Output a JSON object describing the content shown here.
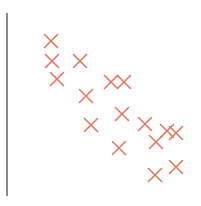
{
  "chart_data": {
    "type": "scatter",
    "title": "",
    "subtitle": "",
    "xlabel": "",
    "ylabel": "",
    "xlim": [
      0,
      201
    ],
    "ylim": [
      206,
      0
    ],
    "grid": false,
    "legend": null,
    "legend_position": "none",
    "annotations": [],
    "xticks": [],
    "yticks": [],
    "xticklabels": [],
    "yticklabels": [],
    "series": [
      {
        "name": "",
        "marker": "x",
        "marker_color": "#e8755c",
        "marker_size": 13,
        "marker_linewidth": 1.6,
        "points": [
          {
            "x": 51,
            "y": 41
          },
          {
            "x": 52,
            "y": 61
          },
          {
            "x": 80,
            "y": 61
          },
          {
            "x": 57,
            "y": 79
          },
          {
            "x": 111,
            "y": 82
          },
          {
            "x": 124,
            "y": 82
          },
          {
            "x": 86,
            "y": 96
          },
          {
            "x": 122,
            "y": 114
          },
          {
            "x": 91,
            "y": 125
          },
          {
            "x": 145,
            "y": 124
          },
          {
            "x": 167,
            "y": 131
          },
          {
            "x": 156,
            "y": 142
          },
          {
            "x": 119,
            "y": 148
          },
          {
            "x": 176,
            "y": 133
          },
          {
            "x": 155,
            "y": 175
          },
          {
            "x": 176,
            "y": 167
          }
        ]
      }
    ],
    "axes": {
      "left_spine": {
        "visible": true,
        "x": 7,
        "y_top": 13,
        "y_bottom": 196,
        "color": "#8a8a8a",
        "width": 1.4
      },
      "bottom_spine": {
        "visible": false
      },
      "top_spine": {
        "visible": false
      },
      "right_spine": {
        "visible": false
      }
    },
    "background_color": "#ffffff"
  },
  "figure": {
    "width": 201,
    "height": 206,
    "alt_text": "Scatter plot fragment with salmon X markers trending downward from upper left to lower right"
  }
}
